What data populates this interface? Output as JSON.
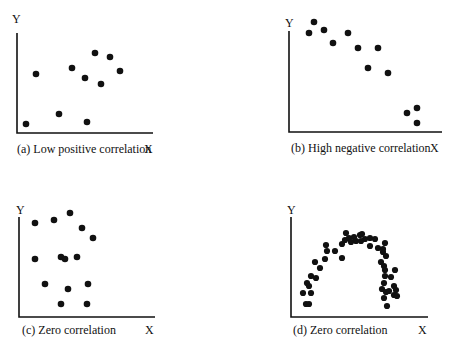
{
  "chart_data": [
    {
      "type": "scatter",
      "title": "(a) Low positive correlation",
      "xlabel": "X",
      "ylabel": "Y",
      "grid": false,
      "points": [
        [
          1,
          1
        ],
        [
          2,
          5.8
        ],
        [
          4.5,
          2
        ],
        [
          5.7,
          6.4
        ],
        [
          7,
          5.5
        ],
        [
          7.2,
          1.1
        ],
        [
          7.9,
          7.9
        ],
        [
          8.5,
          4.9
        ],
        [
          9.4,
          7.5
        ],
        [
          10.4,
          6.1
        ]
      ],
      "svg_points": [
        [
          26,
          124
        ],
        [
          36,
          74
        ],
        [
          59,
          114
        ],
        [
          72,
          68
        ],
        [
          85,
          78
        ],
        [
          87,
          122
        ],
        [
          95,
          53
        ],
        [
          101,
          84
        ],
        [
          110,
          57
        ],
        [
          120,
          71
        ]
      ]
    },
    {
      "type": "scatter",
      "title": "(b) High negative correlation",
      "xlabel": "X",
      "ylabel": "Y",
      "grid": false,
      "points": [
        [
          2,
          10.8
        ],
        [
          2.5,
          11.4
        ],
        [
          3.5,
          10.9
        ],
        [
          4.4,
          9.7
        ],
        [
          5.9,
          10.7
        ],
        [
          6.9,
          9.1
        ],
        [
          8.9,
          9.1
        ],
        [
          7.9,
          7.1
        ],
        [
          9.9,
          6.6
        ],
        [
          11.8,
          2.6
        ],
        [
          12.8,
          3.1
        ],
        [
          12.8,
          1.6
        ]
      ],
      "svg_points": [
        [
          309,
          33
        ],
        [
          314,
          22
        ],
        [
          324,
          30
        ],
        [
          333,
          43
        ],
        [
          348,
          33
        ],
        [
          358,
          48
        ],
        [
          378,
          48
        ],
        [
          368,
          68
        ],
        [
          388,
          73
        ],
        [
          407,
          113
        ],
        [
          417,
          108
        ],
        [
          417,
          123
        ]
      ]
    },
    {
      "type": "scatter",
      "title": "(c) Zero correlation",
      "xlabel": "X",
      "ylabel": "Y",
      "grid": false,
      "points": [
        [
          1.6,
          9.4
        ],
        [
          3.5,
          9.7
        ],
        [
          5.1,
          10.4
        ],
        [
          6.3,
          8.9
        ],
        [
          7.4,
          7.9
        ],
        [
          1.6,
          5.8
        ],
        [
          4.2,
          6
        ],
        [
          4.6,
          5.8
        ],
        [
          5.8,
          6
        ],
        [
          2.6,
          3.3
        ],
        [
          4.9,
          2.8
        ],
        [
          6.9,
          3.3
        ],
        [
          4.2,
          1.3
        ],
        [
          6.8,
          1.3
        ]
      ],
      "svg_points": [
        [
          35,
          223
        ],
        [
          54,
          220
        ],
        [
          70,
          213
        ],
        [
          82,
          228
        ],
        [
          93,
          238
        ],
        [
          35,
          259
        ],
        [
          61,
          257
        ],
        [
          65,
          259
        ],
        [
          77,
          257
        ],
        [
          45,
          284
        ],
        [
          68,
          289
        ],
        [
          88,
          284
        ],
        [
          61,
          304
        ],
        [
          87,
          304
        ]
      ]
    },
    {
      "type": "scatter",
      "title": "(d) Zero correlation",
      "xlabel": "X",
      "ylabel": "Y",
      "grid": false,
      "shape": "inverted-U (arch)",
      "svg_points": [
        [
          303,
          293
        ],
        [
          306,
          304
        ],
        [
          309,
          304
        ],
        [
          307,
          283
        ],
        [
          309,
          286
        ],
        [
          311,
          276
        ],
        [
          311,
          293
        ],
        [
          315,
          262
        ],
        [
          316,
          278
        ],
        [
          320,
          268
        ],
        [
          325,
          259
        ],
        [
          327,
          251
        ],
        [
          326,
          245
        ],
        [
          335,
          251
        ],
        [
          342,
          244
        ],
        [
          342,
          258
        ],
        [
          345,
          240
        ],
        [
          349,
          238
        ],
        [
          346,
          233
        ],
        [
          351,
          242
        ],
        [
          354,
          237
        ],
        [
          356,
          241
        ],
        [
          360,
          235
        ],
        [
          362,
          234
        ],
        [
          365,
          239
        ],
        [
          370,
          238
        ],
        [
          361,
          241
        ],
        [
          370,
          246
        ],
        [
          375,
          239
        ],
        [
          378,
          248
        ],
        [
          385,
          243
        ],
        [
          383,
          249
        ],
        [
          383,
          252
        ],
        [
          386,
          256
        ],
        [
          381,
          262
        ],
        [
          384,
          266
        ],
        [
          385,
          270
        ],
        [
          384,
          283
        ],
        [
          385,
          276
        ],
        [
          382,
          289
        ],
        [
          386,
          292
        ],
        [
          389,
          291
        ],
        [
          384,
          298
        ],
        [
          387,
          306
        ],
        [
          391,
          277
        ],
        [
          395,
          270
        ],
        [
          394,
          286
        ],
        [
          396,
          290
        ],
        [
          394,
          295
        ],
        [
          397,
          296
        ]
      ]
    }
  ],
  "panels": {
    "a": {
      "ylabel": "Y",
      "caption": "(a) Low positive correlation",
      "xlabel": "X"
    },
    "b": {
      "ylabel": "Y",
      "caption": "(b) High negative correlation",
      "xlabel": "X"
    },
    "c": {
      "ylabel": "Y",
      "caption": "(c) Zero correlation",
      "xlabel": "X"
    },
    "d": {
      "ylabel": "Y",
      "caption": "(d) Zero correlation",
      "xlabel": "X"
    }
  }
}
